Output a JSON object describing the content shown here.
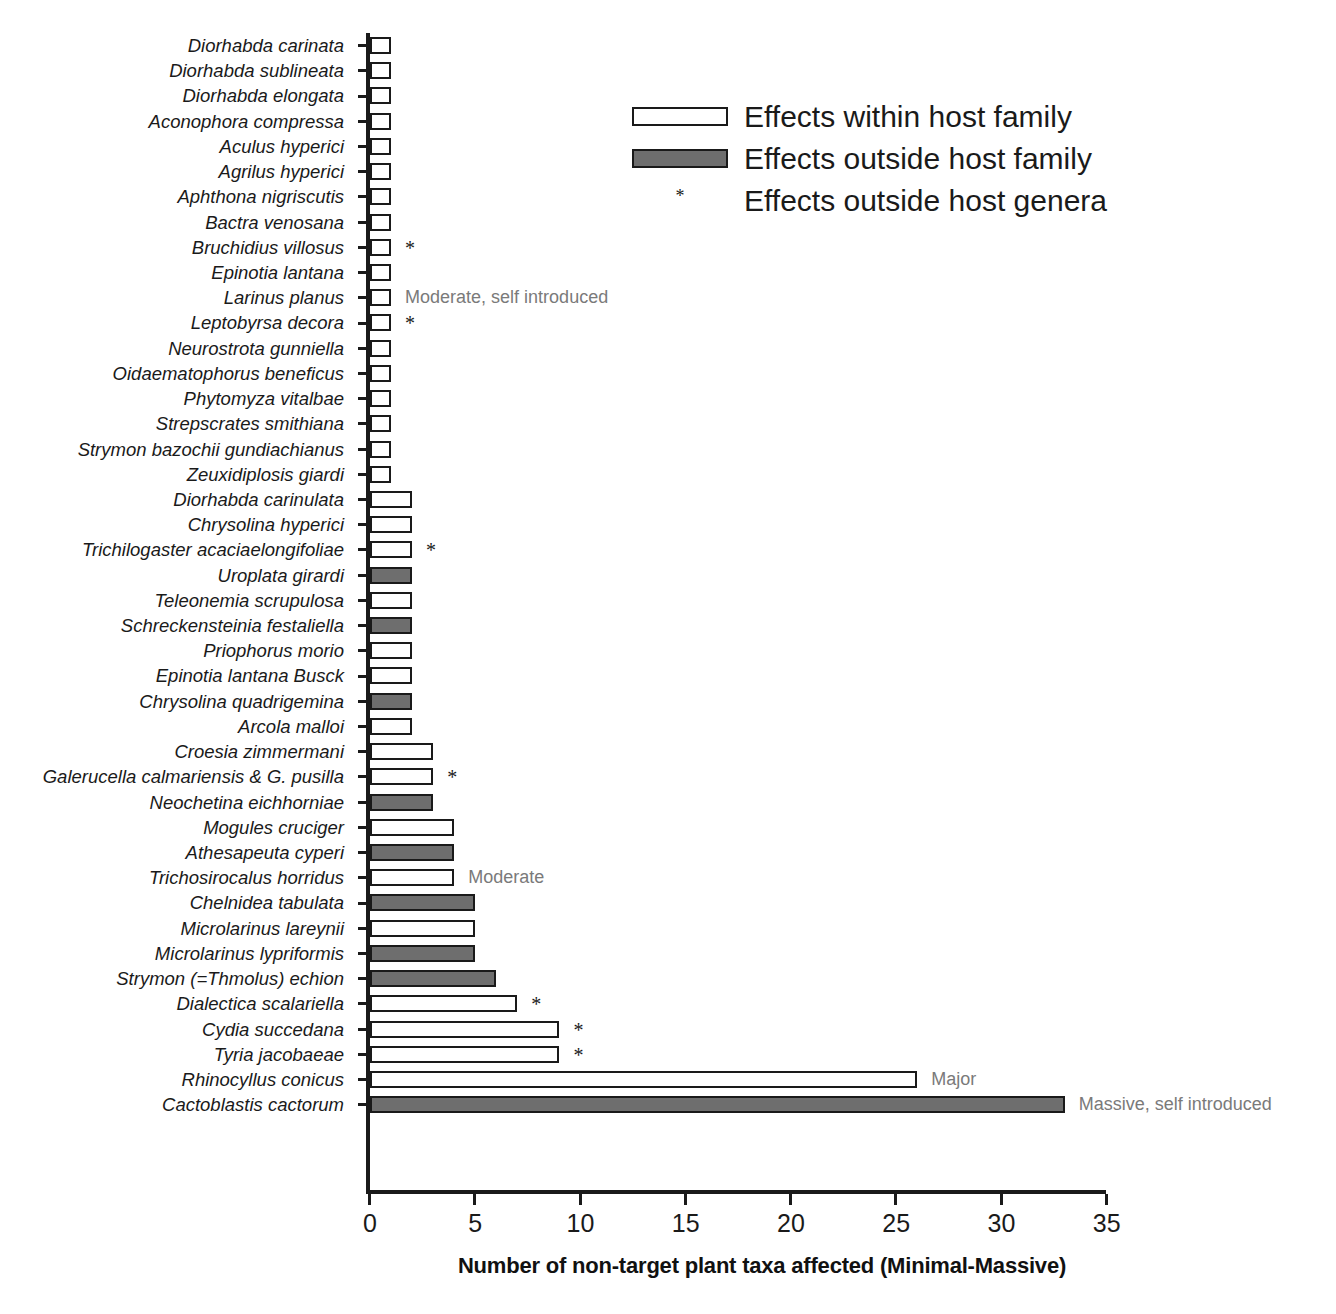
{
  "chart_data": {
    "type": "bar",
    "orientation": "horizontal",
    "title": "",
    "xlabel": "Number of non-target plant taxa affected (Minimal-Massive)",
    "ylabel": "",
    "xlim": [
      0,
      35
    ],
    "xticks": [
      0,
      5,
      10,
      15,
      20,
      25,
      30,
      35
    ],
    "grid": false,
    "legend_position": "top-right",
    "colors": {
      "within_host_family": "#ffffff",
      "outside_host_family": "#6e6e6e",
      "bar_outline": "#1a1a1a",
      "annotation_text": "#7a7a7a",
      "axis": "#1a1a1a"
    },
    "categories": [
      "Diorhabda carinata",
      "Diorhabda sublineata",
      "Diorhabda elongata",
      "Aconophora compressa",
      "Aculus hyperici",
      "Agrilus hyperici",
      "Aphthona nigriscutis",
      "Bactra venosana",
      "Bruchidius villosus",
      "Epinotia lantana",
      "Larinus planus",
      "Leptobyrsa decora",
      "Neurostrota gunniella",
      "Oidaematophorus beneficus",
      "Phytomyza vitalbae",
      "Strepscrates smithiana",
      "Strymon bazochii gundiachianus",
      "Zeuxidiplosis giardi",
      "Diorhabda carinulata",
      "Chrysolina hyperici",
      "Trichilogaster acaciaelongifoliae",
      "Uroplata girardi",
      "Teleonemia scrupulosa",
      "Schreckensteinia festaliella",
      "Priophorus morio",
      "Epinotia lantana Busck",
      "Chrysolina quadrigemina",
      "Arcola malloi",
      "Croesia zimmermani",
      "Galerucella calmariensis & G. pusilla",
      "Neochetina eichhorniae",
      "Mogules cruciger",
      "Athesapeuta cyperi",
      "Trichosirocalus horridus",
      "Chelnidea tabulata",
      "Microlarinus lareynii",
      "Microlarinus lypriformis",
      "Strymon (=Thmolus) echion",
      "Dialectica scalariella",
      "Cydia succedana",
      "Tyria jacobaeae",
      "Rhinocyllus conicus",
      "Cactoblastis cactorum"
    ],
    "values": [
      1,
      1,
      1,
      1,
      1,
      1,
      1,
      1,
      1,
      1,
      1,
      1,
      1,
      1,
      1,
      1,
      1,
      1,
      2,
      2,
      2,
      2,
      2,
      2,
      2,
      2,
      2,
      2,
      3,
      3,
      3,
      4,
      4,
      4,
      5,
      5,
      5,
      6,
      7,
      9,
      9,
      26,
      33
    ],
    "series_assignment": [
      "within",
      "within",
      "within",
      "within",
      "within",
      "within",
      "within",
      "within",
      "within",
      "within",
      "within",
      "within",
      "within",
      "within",
      "within",
      "within",
      "within",
      "within",
      "within",
      "within",
      "within",
      "outside",
      "within",
      "outside",
      "within",
      "within",
      "outside",
      "within",
      "within",
      "within",
      "outside",
      "within",
      "outside",
      "within",
      "outside",
      "within",
      "outside",
      "outside",
      "within",
      "within",
      "within",
      "within",
      "outside"
    ],
    "starred": [
      "Bruchidius villosus",
      "Leptobyrsa decora",
      "Trichilogaster acaciaelongifoliae",
      "Galerucella calmariensis & G. pusilla",
      "Dialectica scalariella",
      "Cydia succedana",
      "Tyria jacobaeae"
    ],
    "annotations": [
      {
        "category": "Larinus planus",
        "text": "Moderate, self introduced"
      },
      {
        "category": "Trichosirocalus horridus",
        "text": "Moderate"
      },
      {
        "category": "Rhinocyllus conicus",
        "text": "Major"
      },
      {
        "category": "Cactoblastis cactorum",
        "text": "Massive, self introduced"
      }
    ],
    "legend": [
      {
        "key": "within",
        "label": "Effects within host family",
        "marker": "open-bar"
      },
      {
        "key": "outside",
        "label": "Effects outside host family",
        "marker": "filled-bar"
      },
      {
        "key": "genera",
        "label": "Effects outside host genera",
        "marker": "asterisk"
      }
    ],
    "star_glyph": "*"
  }
}
